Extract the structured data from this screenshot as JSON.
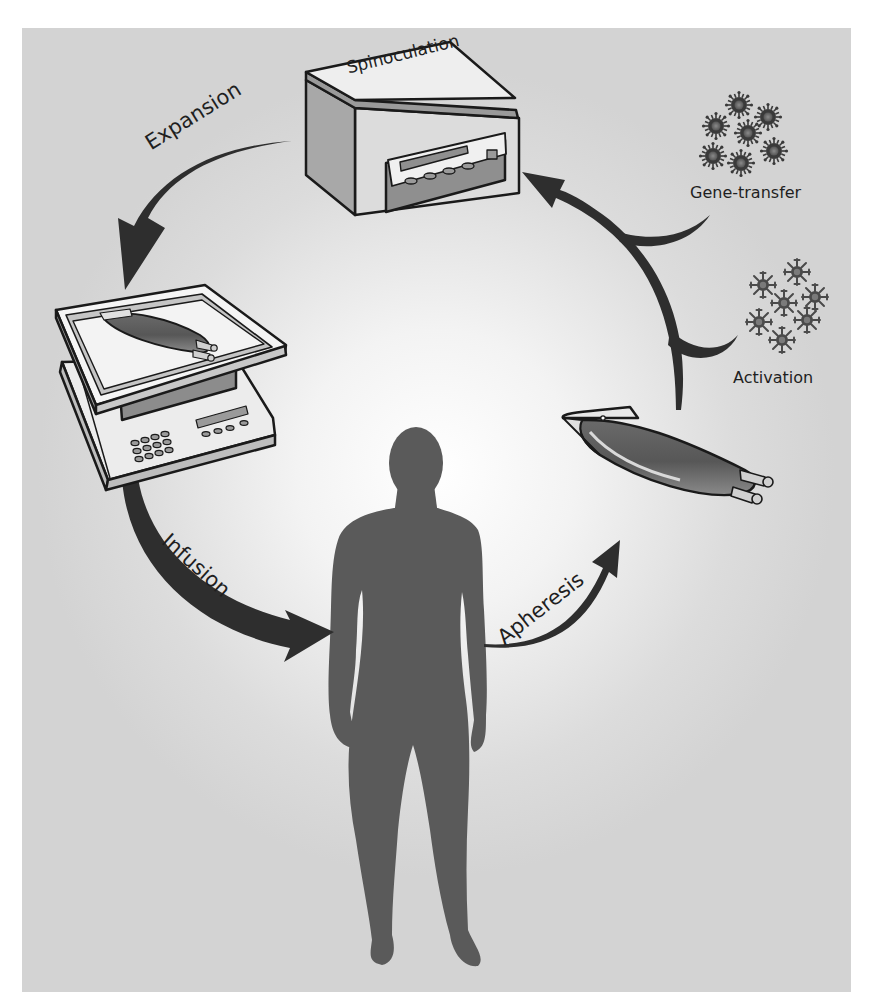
{
  "diagram": {
    "title": "",
    "type": "cycle",
    "stages": [
      {
        "id": "apheresis",
        "label": "Apheresis"
      },
      {
        "id": "activation",
        "label": "Activation"
      },
      {
        "id": "gene_transfer",
        "label": "Gene-transfer"
      },
      {
        "id": "spinoculation",
        "label": "Spinoculation"
      },
      {
        "id": "expansion",
        "label": "Expansion"
      },
      {
        "id": "infusion",
        "label": "Infusion"
      }
    ],
    "flow": [
      {
        "from": "patient",
        "to": "blood-bag",
        "label": "Apheresis"
      },
      {
        "from": "blood-bag",
        "to": "centrifuge",
        "inputs": [
          "Activation",
          "Gene-transfer"
        ]
      },
      {
        "from": "centrifuge",
        "to": "rocking-platform",
        "label": "Expansion"
      },
      {
        "from": "rocking-platform",
        "to": "patient",
        "label": "Infusion"
      }
    ],
    "nodes": {
      "centrifuge": {
        "label": "Spinoculation"
      },
      "patient": {
        "label": ""
      },
      "blood_bag": {
        "label": ""
      },
      "rocking_platform": {
        "label": ""
      }
    },
    "colors": {
      "arrow": "#2e2e2e",
      "silhouette": "#5a5a5a",
      "panel": "#d6d6d6",
      "outline": "#1a1a1a"
    }
  }
}
